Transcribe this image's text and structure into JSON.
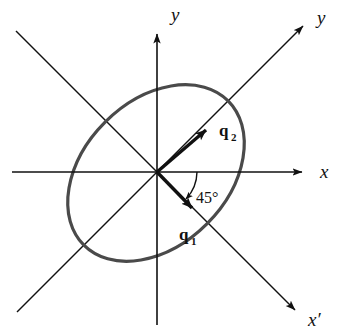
{
  "figure": {
    "background_color": "#ffffff",
    "width": 339,
    "height": 336
  },
  "colors": {
    "axis_line": "#111111",
    "ellipse_stroke": "#4a4a4a",
    "text": "#111111"
  },
  "origin": {
    "x": 157,
    "y": 172
  },
  "axes": [
    {
      "id": "y-axis",
      "label": "y",
      "description": "vertical axis pointing up with arrowhead",
      "arrow": true,
      "label_x": 171,
      "label_y": 21
    },
    {
      "id": "x-axis",
      "label": "x",
      "description": "horizontal axis pointing right with arrowhead",
      "arrow": true,
      "label_x": 320,
      "label_y": 177
    },
    {
      "id": "y-prime-axis",
      "label": "y",
      "description": "rotated axis at 45 degrees pointing up-right with arrowhead",
      "arrow": true,
      "label_x": 318,
      "label_y": 23
    },
    {
      "id": "x-prime-axis",
      "label": "x′",
      "description": "rotated axis at -45 degrees pointing down-right with arrowhead",
      "arrow": true,
      "label_x": 310,
      "label_y": 325
    }
  ],
  "ellipse": {
    "center_x": 156,
    "center_y": 173,
    "semi_major": 102,
    "semi_minor": 72,
    "rotation_deg": -45,
    "stroke_width": 3.2
  },
  "vectors": [
    {
      "id": "q1",
      "label": "q",
      "subscript": "1",
      "direction_deg": -45,
      "description": "unit eigenvector along x-prime axis pointing down-right",
      "tip_x": 196,
      "tip_y": 212,
      "label_x": 179,
      "label_y": 239,
      "sub_x": 194,
      "sub_y": 244
    },
    {
      "id": "q2",
      "label": "q",
      "subscript": "2",
      "direction_deg": 45,
      "description": "unit eigenvector along y-prime axis pointing up-right",
      "tip_x": 209,
      "tip_y": 127,
      "label_x": 219,
      "label_y": 134,
      "sub_x": 233,
      "sub_y": 139
    }
  ],
  "angle_marker": {
    "value": "45°",
    "degrees": 45,
    "between": [
      "x-axis",
      "x-prime-axis"
    ],
    "radius": 40,
    "label_x": 196,
    "label_y": 202
  }
}
